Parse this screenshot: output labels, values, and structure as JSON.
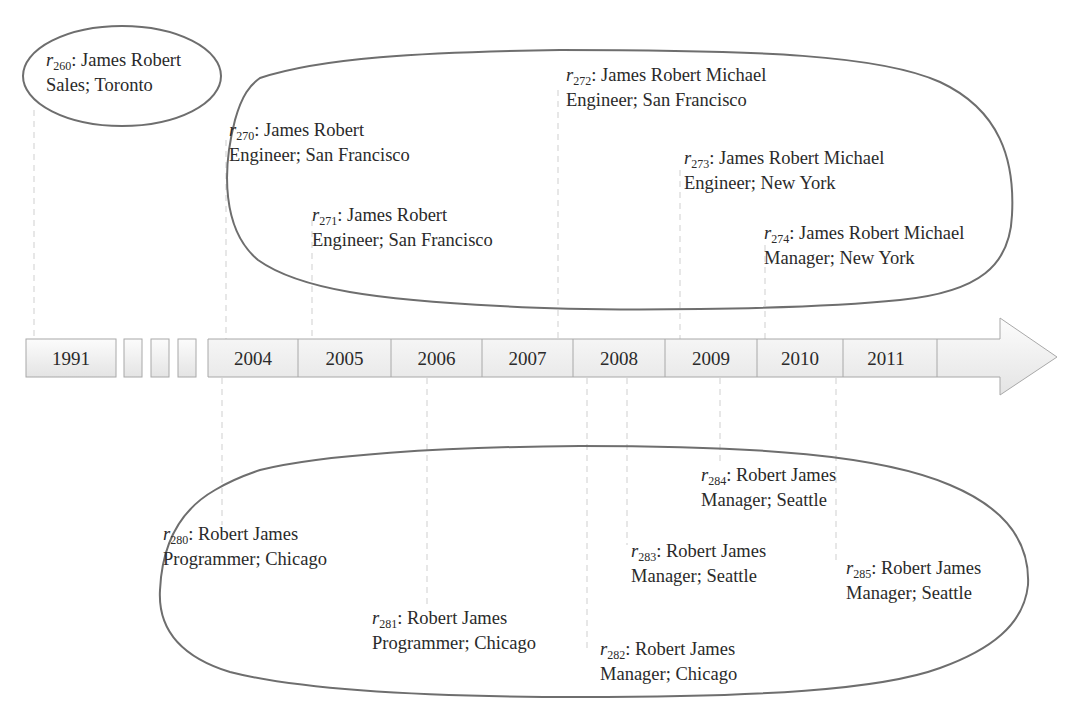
{
  "timeline": {
    "years": [
      {
        "label": "1991",
        "x": 26,
        "w": 90
      },
      {
        "label": "2004",
        "x": 208,
        "w": 90
      },
      {
        "label": "2005",
        "x": 298,
        "w": 93
      },
      {
        "label": "2006",
        "x": 391,
        "w": 91
      },
      {
        "label": "2007",
        "x": 482,
        "w": 91
      },
      {
        "label": "2008",
        "x": 573,
        "w": 92
      },
      {
        "label": "2009",
        "x": 665,
        "w": 92
      },
      {
        "label": "2010",
        "x": 757,
        "w": 86
      },
      {
        "label": "2011",
        "x": 843,
        "w": 86
      }
    ],
    "gap_boxes": 3,
    "arrow": "right-arrow"
  },
  "groups": {
    "james_robert_1991": {
      "records": [
        {
          "id": "r",
          "sub": "260",
          "name": "James Robert",
          "detail": "Sales; Toronto"
        }
      ]
    },
    "james_robert_upper": {
      "records": [
        {
          "id": "r",
          "sub": "270",
          "name": "James Robert",
          "detail": "Engineer; San Francisco"
        },
        {
          "id": "r",
          "sub": "271",
          "name": "James Robert",
          "detail": "Engineer; San Francisco"
        },
        {
          "id": "r",
          "sub": "272",
          "name": "James Robert Michael",
          "detail": "Engineer; San Francisco"
        },
        {
          "id": "r",
          "sub": "273",
          "name": "James Robert Michael",
          "detail": "Engineer; New York"
        },
        {
          "id": "r",
          "sub": "274",
          "name": "James Robert Michael",
          "detail": "Manager; New York"
        }
      ]
    },
    "robert_james_lower": {
      "records": [
        {
          "id": "r",
          "sub": "280",
          "name": "Robert James",
          "detail": "Programmer; Chicago"
        },
        {
          "id": "r",
          "sub": "281",
          "name": "Robert James",
          "detail": "Programmer; Chicago"
        },
        {
          "id": "r",
          "sub": "282",
          "name": "Robert James",
          "detail": "Manager; Chicago"
        },
        {
          "id": "r",
          "sub": "283",
          "name": "Robert James",
          "detail": "Manager; Seattle"
        },
        {
          "id": "r",
          "sub": "284",
          "name": "Robert James",
          "detail": "Manager; Seattle"
        },
        {
          "id": "r",
          "sub": "285",
          "name": "Robert James",
          "detail": "Manager; Seattle"
        }
      ]
    }
  },
  "colors": {
    "outline": "#6e6e6e",
    "box_border": "#a8a8a8",
    "box_fill_top": "#fbfbfb",
    "box_fill_bottom": "#e6e6e6",
    "dash": "#cfcfcf",
    "text": "#2a2a2a"
  }
}
